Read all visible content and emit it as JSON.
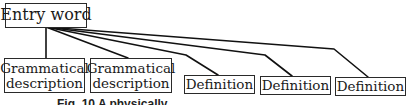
{
  "diagram": {
    "root": {
      "label": "Entry word"
    },
    "children": [
      {
        "line1": "Grammatical",
        "line2": "description"
      },
      {
        "line1": "Grammatical",
        "line2": "description"
      },
      {
        "label": "Definition"
      },
      {
        "label": "Definition"
      },
      {
        "label": "Definition"
      }
    ],
    "caption": "Fig. 10  A physically..."
  },
  "colors": {
    "line": "#111111",
    "box_border": "#2a2a2a",
    "text": "#1a1a1a"
  }
}
